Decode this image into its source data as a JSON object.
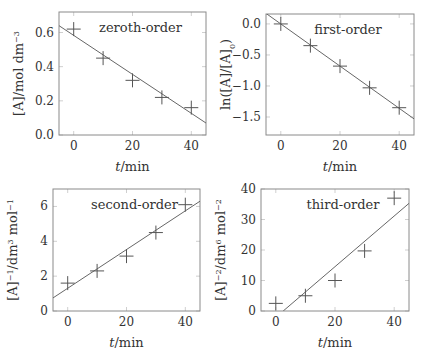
{
  "figure": {
    "xlabel": "t/min"
  },
  "chart_data": [
    {
      "type": "scatter",
      "title": "",
      "annotation": "zeroth-order",
      "xlabel": "t/min",
      "ylabel": "[A]/mol dm^-3",
      "ylabel_parts": {
        "main": "[A]/mol dm",
        "sup": "−3",
        "sub": ""
      },
      "xlim": [
        -5,
        45
      ],
      "ylim": [
        0,
        0.72
      ],
      "xticks": [
        0,
        20,
        40
      ],
      "xtick_labels": [
        "0",
        "20",
        "40"
      ],
      "yticks": [
        0.0,
        0.2,
        0.4,
        0.6
      ],
      "ytick_labels": [
        "0.0",
        "0.2",
        "0.4",
        "0.6"
      ],
      "grid": false,
      "series": [
        {
          "name": "data",
          "marker": "+",
          "x": [
            0,
            10,
            20,
            30,
            40
          ],
          "y": [
            0.62,
            0.45,
            0.32,
            0.22,
            0.16
          ]
        },
        {
          "name": "linear fit",
          "style": "line",
          "x": [
            -5,
            45
          ],
          "y": [
            0.64,
            0.07
          ]
        }
      ],
      "box": {
        "left": 59,
        "top": 12,
        "right": 206,
        "bottom": 135
      }
    },
    {
      "type": "scatter",
      "title": "",
      "annotation": "first-order",
      "xlabel": "t/min",
      "ylabel": "ln([A]/[A]0)",
      "ylabel_parts": {
        "main": "ln([A]/[A]",
        "sup": "",
        "sub": "0",
        "tail": ")"
      },
      "xlim": [
        -5,
        45
      ],
      "ylim": [
        -1.79,
        0.16
      ],
      "xticks": [
        0,
        20,
        40
      ],
      "xtick_labels": [
        "0",
        "20",
        "40"
      ],
      "yticks": [
        0.0,
        -0.5,
        -1.0,
        -1.5
      ],
      "ytick_labels": [
        "0.0",
        "−0.5",
        "−1.0",
        "−1.5"
      ],
      "grid": false,
      "series": [
        {
          "name": "data",
          "marker": "+",
          "x": [
            0,
            10,
            20,
            30,
            40
          ],
          "y": [
            0.0,
            -0.35,
            -0.68,
            -1.03,
            -1.35
          ]
        },
        {
          "name": "linear fit",
          "style": "line",
          "x": [
            -5,
            45
          ],
          "y": [
            0.17,
            -1.53
          ]
        }
      ],
      "box": {
        "left": 266,
        "top": 14,
        "right": 414,
        "bottom": 135
      }
    },
    {
      "type": "scatter",
      "title": "",
      "annotation": "second-order",
      "xlabel": "t/min",
      "ylabel": "[A]^-1/dm^3 mol^-1",
      "ylabel_parts": {
        "main": "[A]",
        "sup": "−1",
        "mid": "/dm",
        "sup2": "3",
        "mid2": " mol",
        "sup3": "−1"
      },
      "xlim": [
        -5,
        45
      ],
      "ylim": [
        0,
        7
      ],
      "xticks": [
        0,
        20,
        40
      ],
      "xtick_labels": [
        "0",
        "20",
        "40"
      ],
      "yticks": [
        0,
        2,
        4,
        6
      ],
      "ytick_labels": [
        "0",
        "2",
        "4",
        "6"
      ],
      "grid": false,
      "series": [
        {
          "name": "data",
          "marker": "+",
          "x": [
            0,
            10,
            20,
            30,
            40
          ],
          "y": [
            1.6,
            2.3,
            3.15,
            4.5,
            6.1
          ]
        },
        {
          "name": "linear fit",
          "style": "line",
          "x": [
            -5,
            45
          ],
          "y": [
            0.75,
            6.3
          ]
        }
      ],
      "box": {
        "left": 53,
        "top": 189,
        "right": 200,
        "bottom": 311
      }
    },
    {
      "type": "scatter",
      "title": "",
      "annotation": "third-order",
      "xlabel": "t/min",
      "ylabel": "[A]^-2/dm^6 mol^-2",
      "ylabel_parts": {
        "main": "[A]",
        "sup": "−2",
        "mid": "/dm",
        "sup2": "6",
        "mid2": " mol",
        "sup3": "−2"
      },
      "xlim": [
        -5,
        45
      ],
      "ylim": [
        0,
        40
      ],
      "xticks": [
        0,
        20,
        40
      ],
      "xtick_labels": [
        "0",
        "20",
        "40"
      ],
      "yticks": [
        0,
        10,
        20,
        30,
        40
      ],
      "ytick_labels": [
        "0",
        "10",
        "20",
        "30",
        "40"
      ],
      "grid": false,
      "series": [
        {
          "name": "data",
          "marker": "+",
          "x": [
            0,
            10,
            20,
            30,
            40
          ],
          "y": [
            2.5,
            5,
            10,
            19.7,
            37
          ]
        },
        {
          "name": "linear fit",
          "style": "line",
          "x": [
            2.5,
            45
          ],
          "y": [
            0,
            35.3
          ]
        }
      ],
      "box": {
        "left": 261,
        "top": 189,
        "right": 409,
        "bottom": 311
      }
    }
  ]
}
